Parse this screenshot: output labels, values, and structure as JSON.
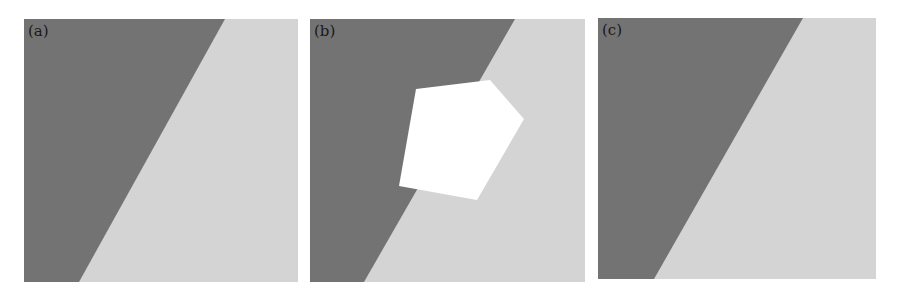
{
  "figure": {
    "colors": {
      "dark": "#737373",
      "light": "#d4d4d4",
      "hole": "#ffffff",
      "border": "#c8c8c8"
    },
    "panels": [
      {
        "label": "(a)",
        "description": "Original image: two-region step edge (dark left, light right)"
      },
      {
        "label": "(b)",
        "description": "Image with white pentagonal region removed (missing data)"
      },
      {
        "label": "(c)",
        "description": "Inpainted / reconstructed image restoring the step edge"
      }
    ]
  }
}
